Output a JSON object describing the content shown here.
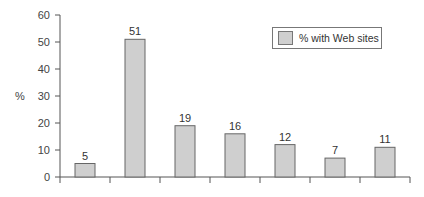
{
  "chart_data": {
    "type": "bar",
    "title": "",
    "xlabel": "",
    "ylabel": "%",
    "ylim": [
      0,
      60
    ],
    "yticks": [
      0,
      10,
      20,
      30,
      40,
      50,
      60
    ],
    "categories": [
      "",
      "",
      "",
      "",
      "",
      "",
      ""
    ],
    "series": [
      {
        "name": "% with Web sites",
        "values": [
          5,
          51,
          19,
          16,
          12,
          7,
          11
        ],
        "color": "#cfcfcf"
      }
    ],
    "value_labels": [
      "5",
      "51",
      "19",
      "16",
      "12",
      "7",
      "11"
    ],
    "legend": {
      "position": "upper-right",
      "entries": [
        "% with Web sites"
      ]
    },
    "grid": false
  }
}
